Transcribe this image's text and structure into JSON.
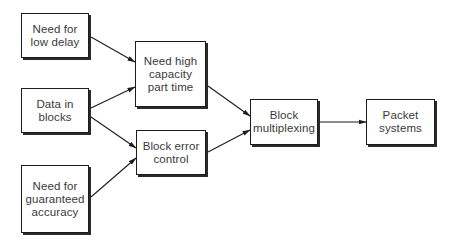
{
  "diagram": {
    "type": "flowchart",
    "colors": {
      "stroke": "#1c1c1c",
      "text": "#3a3a3a",
      "background": "#ffffff"
    },
    "nodes": [
      {
        "id": "low-delay",
        "label": "Need for\nlow delay"
      },
      {
        "id": "data-blocks",
        "label": "Data in\nblocks"
      },
      {
        "id": "guaranteed-accuracy",
        "label": "Need for\nguaranteed\naccuracy"
      },
      {
        "id": "high-capacity",
        "label": "Need high\ncapacity\npart time"
      },
      {
        "id": "block-error-control",
        "label": "Block error\ncontrol"
      },
      {
        "id": "block-multiplexing",
        "label": "Block\nmultiplexing"
      },
      {
        "id": "packet-systems",
        "label": "Packet\nsystems"
      }
    ],
    "edges": [
      {
        "from": "low-delay",
        "to": "high-capacity"
      },
      {
        "from": "data-blocks",
        "to": "high-capacity"
      },
      {
        "from": "data-blocks",
        "to": "block-error-control"
      },
      {
        "from": "guaranteed-accuracy",
        "to": "block-error-control"
      },
      {
        "from": "high-capacity",
        "to": "block-multiplexing"
      },
      {
        "from": "block-error-control",
        "to": "block-multiplexing"
      },
      {
        "from": "block-multiplexing",
        "to": "packet-systems"
      }
    ]
  }
}
